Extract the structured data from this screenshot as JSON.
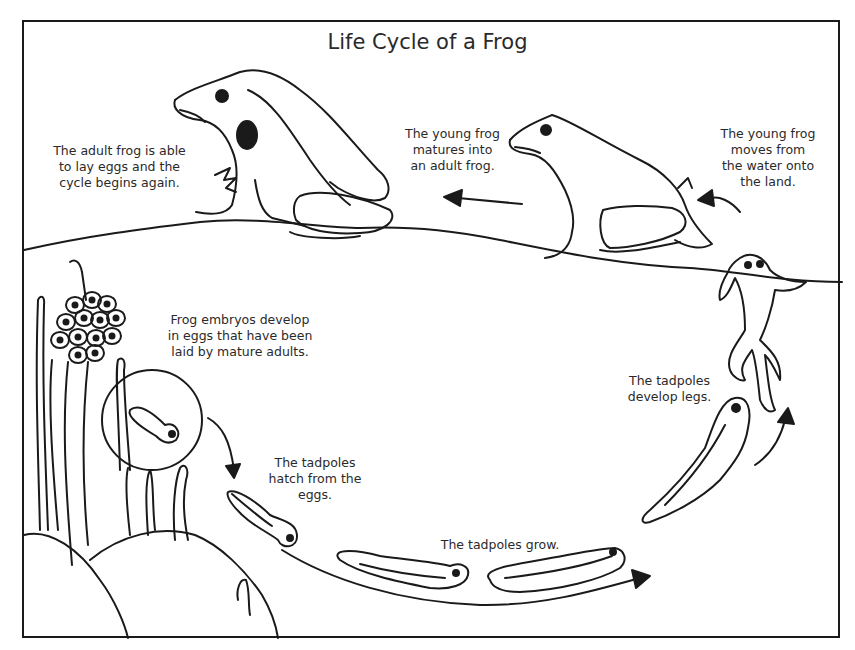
{
  "title": "Life Cycle of a Frog",
  "stages": [
    {
      "id": "adult",
      "label": "The adult frog is able\nto lay eggs and the\ncycle begins again."
    },
    {
      "id": "young-matures",
      "label": "The young frog\nmatures into\nan adult frog."
    },
    {
      "id": "young-moves",
      "label": "The young frog\nmoves from\nthe water onto\nthe land."
    },
    {
      "id": "embryos",
      "label": "Frog embryos develop\nin eggs that have been\nlaid by mature adults."
    },
    {
      "id": "hatch",
      "label": "The tadpoles\nhatch from the\neggs."
    },
    {
      "id": "grow",
      "label": "The tadpoles grow."
    },
    {
      "id": "legs",
      "label": "The tadpoles\ndevelop legs."
    }
  ],
  "colors": {
    "line": "#1a1a1a",
    "text": "#2a2a2a",
    "background": "#ffffff"
  }
}
